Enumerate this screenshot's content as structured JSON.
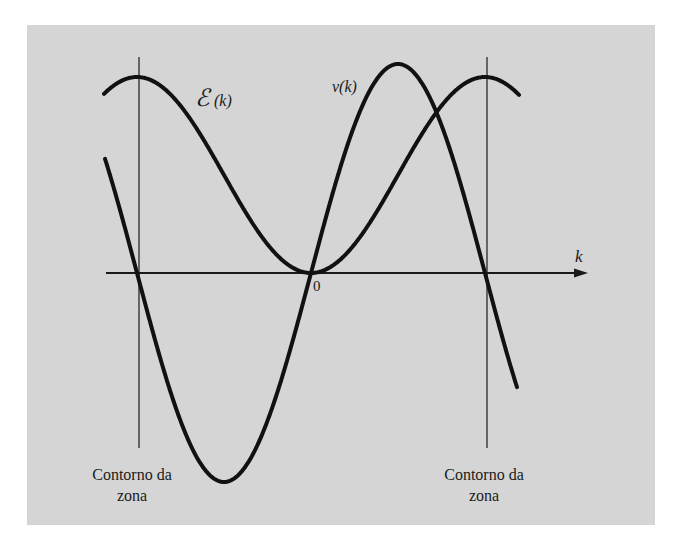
{
  "figure": {
    "axis_label": "k",
    "origin_label": "0",
    "energy_label_symbol": "ℰ",
    "energy_label_arg": "(k)",
    "velocity_label": "v(k)",
    "left_boundary_label_line1": "Contorno da",
    "left_boundary_label_line2": "zona",
    "right_boundary_label_line1": "Contorno da",
    "right_boundary_label_line2": "zona",
    "background_color": "#d5d5d5",
    "curve_color": "#111111"
  },
  "chart_data": {
    "type": "line",
    "title": "",
    "xlabel": "k",
    "ylabel": "",
    "x_ticks": [
      "0"
    ],
    "annotations": [
      "Contorno da zona (left, k = -π/a)",
      "Contorno da zona (right, k = +π/a)"
    ],
    "x": [
      -1.2,
      -1.0,
      -0.75,
      -0.5,
      -0.25,
      0,
      0.25,
      0.5,
      0.75,
      1.0,
      1.2
    ],
    "series": [
      {
        "name": "ℰ(k)",
        "shape": "1 - cos(πk)",
        "values": [
          1.81,
          2.0,
          1.71,
          1.0,
          0.29,
          0.0,
          0.29,
          1.0,
          1.71,
          2.0,
          1.81
        ]
      },
      {
        "name": "v(k)",
        "shape": "sin(πk)",
        "values": [
          0.59,
          0.0,
          -0.71,
          -1.0,
          -0.71,
          0.0,
          0.71,
          1.0,
          0.71,
          0.0,
          -0.59
        ]
      }
    ],
    "xlim": [
      -1.2,
      1.4
    ],
    "grid": false,
    "legend": "inline labels"
  }
}
